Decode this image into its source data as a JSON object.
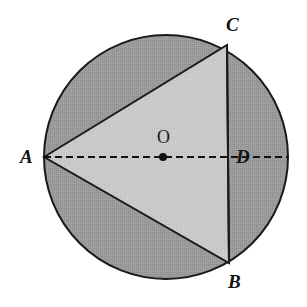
{
  "figure": {
    "type": "geometry-diagram",
    "canvas": {
      "width": 307,
      "height": 307,
      "background": "#ffffff"
    },
    "circle": {
      "name": "circle-O",
      "center_x": 166,
      "center_y": 157,
      "radius": 122,
      "fill": "#9a9a9a",
      "stroke": "#1a1a1a",
      "stroke_width": 2
    },
    "triangle": {
      "name": "triangle-ABC",
      "fill": "#c9c9c9",
      "stroke": "#1a1a1a",
      "stroke_width": 2,
      "points": "44,157 227,45 229,263"
    },
    "chord_bc": {
      "name": "chord-BC",
      "x1": 227,
      "y1": 45,
      "x2": 229,
      "y2": 263,
      "stroke": "#1a1a1a",
      "stroke_width": 2
    },
    "diameter": {
      "name": "diameter-AD",
      "x1": 44,
      "y1": 157,
      "x2": 288,
      "y2": 157,
      "stroke": "#111111",
      "stroke_width": 2,
      "dash": "7 4"
    },
    "center_dot": {
      "name": "center-point-O",
      "cx": 163,
      "cy": 157,
      "r": 4,
      "fill": "#111111"
    },
    "labels": {
      "A": "A",
      "B": "B",
      "C": "C",
      "D": "D",
      "O": "O"
    }
  }
}
